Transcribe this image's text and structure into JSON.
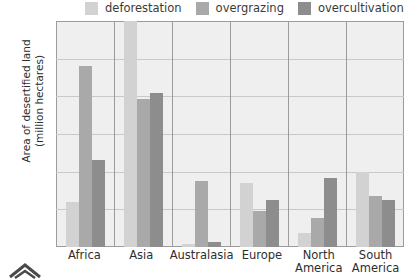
{
  "chart_data": {
    "type": "bar",
    "title": "",
    "xlabel": "",
    "ylabel": "Area of desertified land (million hectares)",
    "ylabel_line1": "Area of desertified land",
    "ylabel_line2": "(million hectares)",
    "categories": [
      "Africa",
      "Asia",
      "Australasia",
      "Europe",
      "North America",
      "South America"
    ],
    "category_lines": [
      [
        "Africa"
      ],
      [
        "Asia"
      ],
      [
        "Australasia"
      ],
      [
        "Europe"
      ],
      [
        "North",
        "America"
      ],
      [
        "South",
        "America"
      ]
    ],
    "series": [
      {
        "name": "deforestation",
        "color": "#d2d2d2",
        "values": [
          60,
          310,
          4,
          85,
          18,
          100
        ]
      },
      {
        "name": "overgrazing",
        "color": "#a9a9a9",
        "values": [
          240,
          197,
          87,
          48,
          38,
          68
        ]
      },
      {
        "name": "overcultivation",
        "color": "#8d8d8d",
        "values": [
          115,
          205,
          6,
          62,
          92,
          63
        ]
      }
    ],
    "clipped_bars": [
      {
        "category": "Asia",
        "series": "deforestation",
        "note": "exceeds axis maximum"
      }
    ],
    "ylim": [
      0,
      300
    ],
    "yticks": [
      0,
      50,
      100,
      150,
      200,
      250,
      300
    ],
    "ytick_labels": [
      "0",
      "50",
      "100",
      "150",
      "200",
      "250",
      "300"
    ],
    "grid": true,
    "legend_position": "top"
  },
  "legend": {
    "entries": [
      {
        "label": "deforestation",
        "color": "#d2d2d2"
      },
      {
        "label": "overgrazing",
        "color": "#a9a9a9"
      },
      {
        "label": "overcultivation",
        "color": "#8d8d8d"
      }
    ]
  },
  "colors": {
    "plot_background": "#efefef",
    "axis": "#9b9b9b",
    "gridline": "#c9c9c9",
    "text": "#2e2e2e"
  }
}
